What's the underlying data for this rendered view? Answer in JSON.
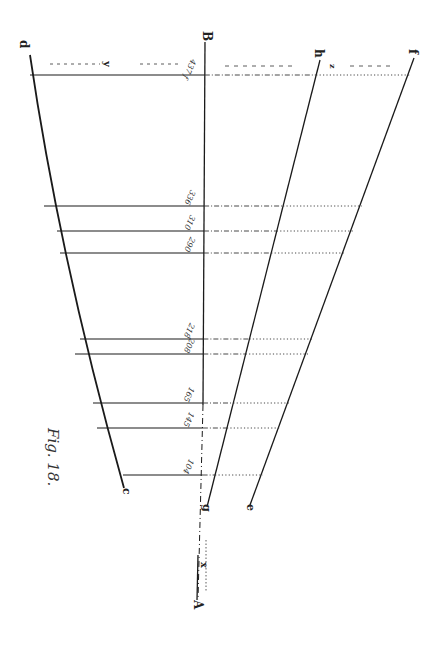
{
  "figure": {
    "title": "Fig. 18.",
    "points": {
      "A": "A",
      "B": "B",
      "c": "c",
      "d": "d",
      "e": "e",
      "f": "f",
      "g": "g",
      "h": "h",
      "x": "x",
      "y": "y",
      "z": "z"
    },
    "ordinate_labels": [
      "437 f",
      "336",
      "310",
      "290",
      "218",
      "208",
      "165",
      "145",
      "104"
    ],
    "line_color": "#1a1a1a"
  }
}
